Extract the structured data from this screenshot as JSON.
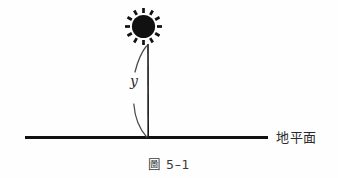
{
  "figure": {
    "caption_prefix": "圖",
    "caption_number": "5–1",
    "caption_full": "圖 5–1",
    "background_color": "#fefefe",
    "ink_color": "#111111"
  },
  "labels": {
    "ground_label": "地平面",
    "height_variable": "y"
  },
  "diagram": {
    "sun": {
      "name": "sun",
      "center_x": 143.5,
      "center_y": 26.5,
      "core_radius": 11.5,
      "ray_count": 12,
      "ray_inner_radius": 13.5,
      "ray_outer_radius": 18.5,
      "color": "#111111"
    },
    "height_line": {
      "name": "vertical-height-line",
      "x": 148,
      "y_top": 44,
      "y_bottom": 138,
      "color": "#1a1a1a",
      "stroke_width": 1.6
    },
    "measure_brace": {
      "name": "height-measure-brace",
      "color": "#4a4a4a",
      "stroke_width": 1.2,
      "upper_from_y": 46,
      "upper_to_y": 72,
      "lower_from_y": 104,
      "lower_to_y": 138
    },
    "ground_line": {
      "name": "ground-horizon-line",
      "x_start": 25,
      "x_end": 268,
      "y": 137.5,
      "color": "#111111",
      "stroke_width": 3.2
    }
  }
}
